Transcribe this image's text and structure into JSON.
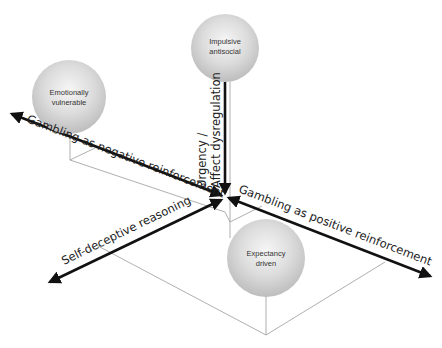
{
  "diagram": {
    "type": "3d-axes-concept-diagram",
    "colors": {
      "background": "#ffffff",
      "axis": "#111111",
      "guide_line": "#9a9a9a",
      "sphere_light": "#f4f4f4",
      "sphere_dark": "#bdbdbd",
      "text": "#222222"
    },
    "axes": {
      "vertical": {
        "label_line1": "Urgency /",
        "label_line2": "Affect dysregulation"
      },
      "negative": {
        "label": "Gambling as negative reinforcement"
      },
      "positive": {
        "label": "Gambling as positive reinforcement"
      },
      "self_deceptive": {
        "label": "Self-deceptive reasoning"
      }
    },
    "nodes": [
      {
        "id": "impulsive",
        "line1": "Impulsive",
        "line2": "antisocial"
      },
      {
        "id": "emotional",
        "line1": "Emotionally",
        "line2": "vulnerable"
      },
      {
        "id": "expectancy",
        "line1": "Expectancy",
        "line2": "driven"
      }
    ]
  }
}
